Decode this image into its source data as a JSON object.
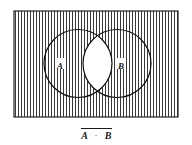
{
  "figure": {
    "name": "venn-diagram-nand",
    "universe": {
      "name": "universe-rectangle",
      "x": 14,
      "y": 11,
      "width": 164,
      "height": 106,
      "border_color": "#222222",
      "fill_color": "#ffffff"
    },
    "shading": {
      "pattern": "vertical-lines",
      "line_color": "#3a3a3a",
      "line_spacing": 3,
      "line_width": 1,
      "shaded_region": "complement of A intersect B"
    },
    "circles": [
      {
        "name": "circle-a",
        "label": "A",
        "cx": 78,
        "cy": 63.5,
        "r": 34,
        "stroke_color": "#111111",
        "label_x": 60,
        "label_y": 66
      },
      {
        "name": "circle-b",
        "label": "B",
        "cx": 117,
        "cy": 63.5,
        "r": 34,
        "stroke_color": "#111111",
        "label_x": 121,
        "label_y": 66
      }
    ],
    "intersection": {
      "name": "intersection-lens",
      "fill_color": "#ffffff",
      "shaded": false
    },
    "caption": {
      "name": "expression-caption",
      "left_term": "A",
      "operator": "·",
      "right_term": "B",
      "overbar": true,
      "text": "A · B",
      "center_x": 96,
      "baseline_y": 138,
      "bar_y": 128
    }
  },
  "chart_data": {
    "type": "diagram",
    "title": "A · B",
    "sets": [
      "A",
      "B"
    ],
    "regions": [
      {
        "name": "A only",
        "shaded": true
      },
      {
        "name": "B only",
        "shaded": true
      },
      {
        "name": "A and B",
        "shaded": false
      },
      {
        "name": "outside A and B",
        "shaded": true
      }
    ]
  }
}
